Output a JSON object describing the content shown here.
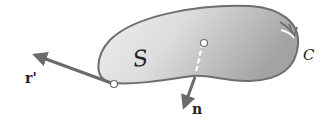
{
  "labels": {
    "surface": "S",
    "curve": "C",
    "tangent_vector": "r'",
    "normal_vector": "n"
  },
  "colors": {
    "background": "#ffffff",
    "outline": "#6e6e6e",
    "arrow": "#6b6b6b",
    "fill_light": "#ededed",
    "fill_dark": "#a9a9a9",
    "text": "#222222"
  }
}
